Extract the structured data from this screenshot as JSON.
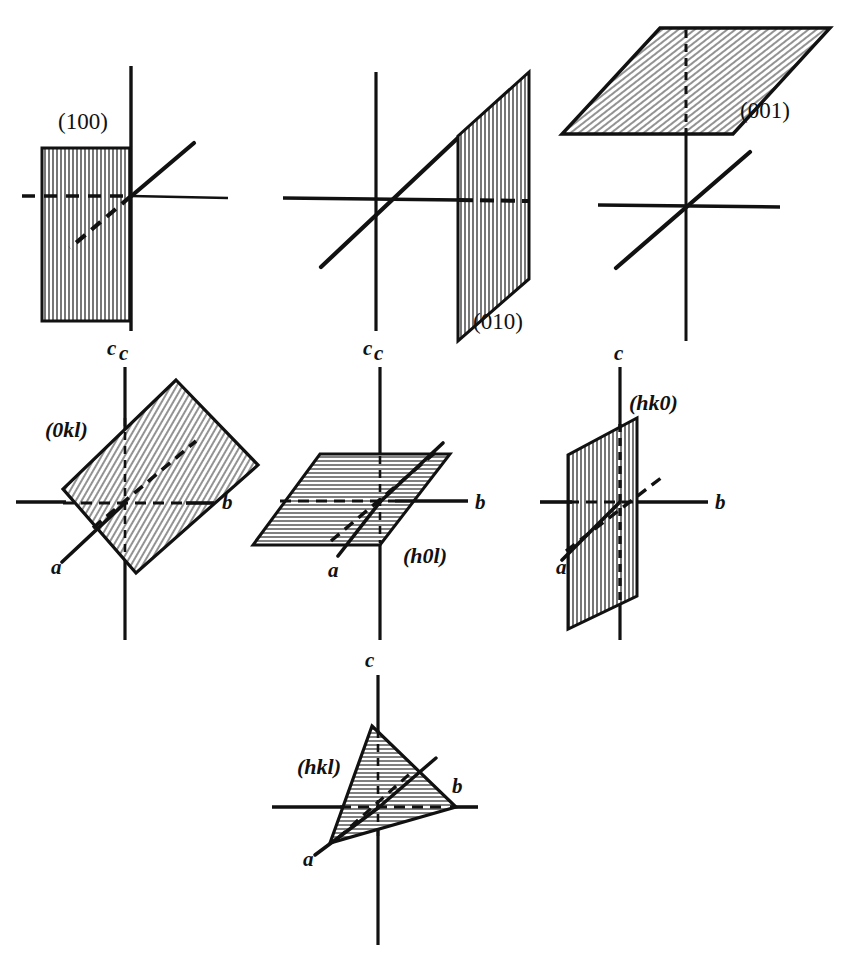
{
  "figure": {
    "ink_color": "#111111",
    "paper_color": "#ffffff",
    "hatch_color": "#333333",
    "rows": 3
  },
  "panels": [
    {
      "id": "panel-100",
      "index_label": "(100)",
      "style": "upright",
      "plane_type": "vertical-rectangle",
      "hatching": "vertical",
      "axis_labels": [
        "c"
      ],
      "label_pos": {
        "x": 92,
        "y": 129
      },
      "origin": {
        "x": 131,
        "y": 196
      },
      "c_label": {
        "x": 112,
        "y": 350
      }
    },
    {
      "id": "panel-010",
      "index_label": "(010)",
      "style": "upright",
      "plane_type": "vertical-parallelogram",
      "hatching": "vertical",
      "axis_labels": [
        "c"
      ],
      "label_pos": {
        "x": 478,
        "y": 329
      },
      "origin": {
        "x": 376,
        "y": 200
      },
      "c_label": {
        "x": 368,
        "y": 350
      }
    },
    {
      "id": "panel-001",
      "index_label": "(001)",
      "style": "upright",
      "plane_type": "horizontal-parallelogram",
      "hatching": "diagonal",
      "axis_labels": [
        "c"
      ],
      "label_pos": {
        "x": 744,
        "y": 120
      },
      "origin": {
        "x": 686,
        "y": 207
      },
      "c_label": {
        "x": 676,
        "y": 350
      }
    },
    {
      "id": "panel-0kl",
      "index_label": "(0kl)",
      "style": "italic",
      "plane_type": "tilted-rectangle",
      "hatching": "diagonal",
      "axis_labels": [
        "a",
        "b",
        "c"
      ],
      "label_pos": {
        "x": 48,
        "y": 437
      },
      "origin": {
        "x": 125,
        "y": 503
      },
      "a_label": {
        "x": 56,
        "y": 570
      },
      "b_label": {
        "x": 225,
        "y": 508
      },
      "c_label": {
        "x": 113,
        "y": 355
      }
    },
    {
      "id": "panel-h0l",
      "index_label": "(h0l)",
      "style": "italic",
      "plane_type": "horizontal-parallelogram",
      "hatching": "horizontal",
      "axis_labels": [
        "a",
        "b",
        "c"
      ],
      "label_pos": {
        "x": 407,
        "y": 561
      },
      "origin": {
        "x": 380,
        "y": 502
      },
      "a_label": {
        "x": 332,
        "y": 573
      },
      "b_label": {
        "x": 478,
        "y": 508
      },
      "c_label": {
        "x": 368,
        "y": 355
      }
    },
    {
      "id": "panel-hk0",
      "index_label": "(hk0)",
      "style": "italic",
      "plane_type": "vertical-parallelogram",
      "hatching": "vertical",
      "axis_labels": [
        "a",
        "b",
        "c"
      ],
      "label_pos": {
        "x": 632,
        "y": 409
      },
      "origin": {
        "x": 620,
        "y": 502
      },
      "a_label": {
        "x": 560,
        "y": 570
      },
      "b_label": {
        "x": 718,
        "y": 508
      },
      "c_label": {
        "x": 606,
        "y": 355
      }
    },
    {
      "id": "panel-hkl",
      "index_label": "(hkl)",
      "style": "italic",
      "plane_type": "triangle",
      "hatching": "horizontal",
      "axis_labels": [
        "a",
        "b",
        "c"
      ],
      "label_pos": {
        "x": 300,
        "y": 772
      },
      "origin": {
        "x": 378,
        "y": 808
      },
      "a_label": {
        "x": 307,
        "y": 862
      },
      "b_label": {
        "x": 456,
        "y": 789
      },
      "c_label": {
        "x": 370,
        "y": 662
      }
    }
  ],
  "axis_names": {
    "a": "a",
    "b": "b",
    "c": "c"
  },
  "indices": {
    "m100": "(100)",
    "m010": "(010)",
    "m001": "(001)",
    "m0kl": "(0kl)",
    "mh0l": "(h0l)",
    "mhk0": "(hk0)",
    "mhkl": "(hkl)"
  }
}
